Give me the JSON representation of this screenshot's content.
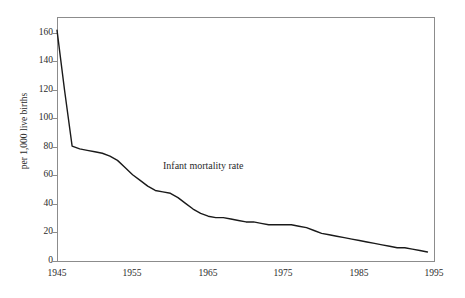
{
  "chart_data": {
    "type": "line",
    "title": "",
    "xlabel": "",
    "ylabel": "per 1,000 live births",
    "annotation": "Infant mortality rate",
    "grid": false,
    "legend": "none",
    "xlim": [
      1945,
      1995
    ],
    "ylim": [
      0,
      170
    ],
    "x_ticks": [
      "1945",
      "1955",
      "1965",
      "1975",
      "1985",
      "1995"
    ],
    "y_ticks": [
      "0",
      "20",
      "40",
      "60",
      "80",
      "100",
      "120",
      "140",
      "160"
    ],
    "series": [
      {
        "name": "Infant mortality rate",
        "color": "#1a1a1a",
        "x": [
          1945,
          1946,
          1947,
          1948,
          1949,
          1950,
          1951,
          1952,
          1953,
          1954,
          1955,
          1956,
          1957,
          1958,
          1959,
          1960,
          1961,
          1962,
          1963,
          1964,
          1965,
          1966,
          1967,
          1968,
          1969,
          1970,
          1971,
          1972,
          1973,
          1974,
          1975,
          1976,
          1977,
          1978,
          1979,
          1980,
          1981,
          1982,
          1983,
          1984,
          1985,
          1986,
          1987,
          1988,
          1989,
          1990,
          1991,
          1992,
          1993,
          1994
        ],
        "values": [
          162,
          120,
          81,
          79,
          78,
          77,
          76,
          74,
          71,
          66,
          61,
          57,
          53,
          50,
          49,
          48,
          45,
          41,
          37,
          34,
          32,
          31,
          31,
          30,
          29,
          28,
          28,
          27,
          26,
          26,
          26,
          26,
          25,
          24,
          22,
          20,
          19,
          18,
          17,
          16,
          15,
          14,
          13,
          12,
          11,
          10,
          10,
          9,
          8,
          7
        ]
      }
    ]
  },
  "axes": {
    "y_title": "per 1,000 live births",
    "y_tick_labels": [
      "160",
      "140",
      "120",
      "100",
      "80",
      "60",
      "40",
      "20",
      "0"
    ],
    "x_tick_labels": [
      "1945",
      "1955",
      "1965",
      "1975",
      "1985",
      "1995"
    ]
  },
  "annotations": {
    "series_label": "Infant mortality rate"
  }
}
